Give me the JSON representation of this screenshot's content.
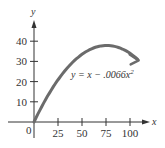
{
  "chart_data": {
    "type": "line",
    "title": "",
    "xlabel": "x",
    "ylabel": "y",
    "equation": "y = x − .0066x",
    "equation_exponent": "2",
    "origin_label": "0",
    "x_ticks": [
      25,
      50,
      75,
      100
    ],
    "y_ticks": [
      10,
      20,
      30,
      40
    ],
    "xlim": [
      0,
      118
    ],
    "ylim": [
      0,
      48
    ],
    "grid": false,
    "legend": null,
    "series": [
      {
        "name": "y = x - .0066x^2",
        "color": "#6b6b6b",
        "x": [
          0,
          10,
          20,
          30,
          40,
          50,
          60,
          70,
          75,
          80,
          90,
          100,
          108
        ],
        "y": [
          0,
          9.34,
          17.36,
          24.06,
          29.44,
          33.5,
          36.24,
          37.66,
          37.88,
          37.76,
          36.54,
          34.0,
          31.0
        ]
      }
    ]
  },
  "colors": {
    "axis": "#333333",
    "curve": "#6b6b6b",
    "background": "#ffffff"
  }
}
